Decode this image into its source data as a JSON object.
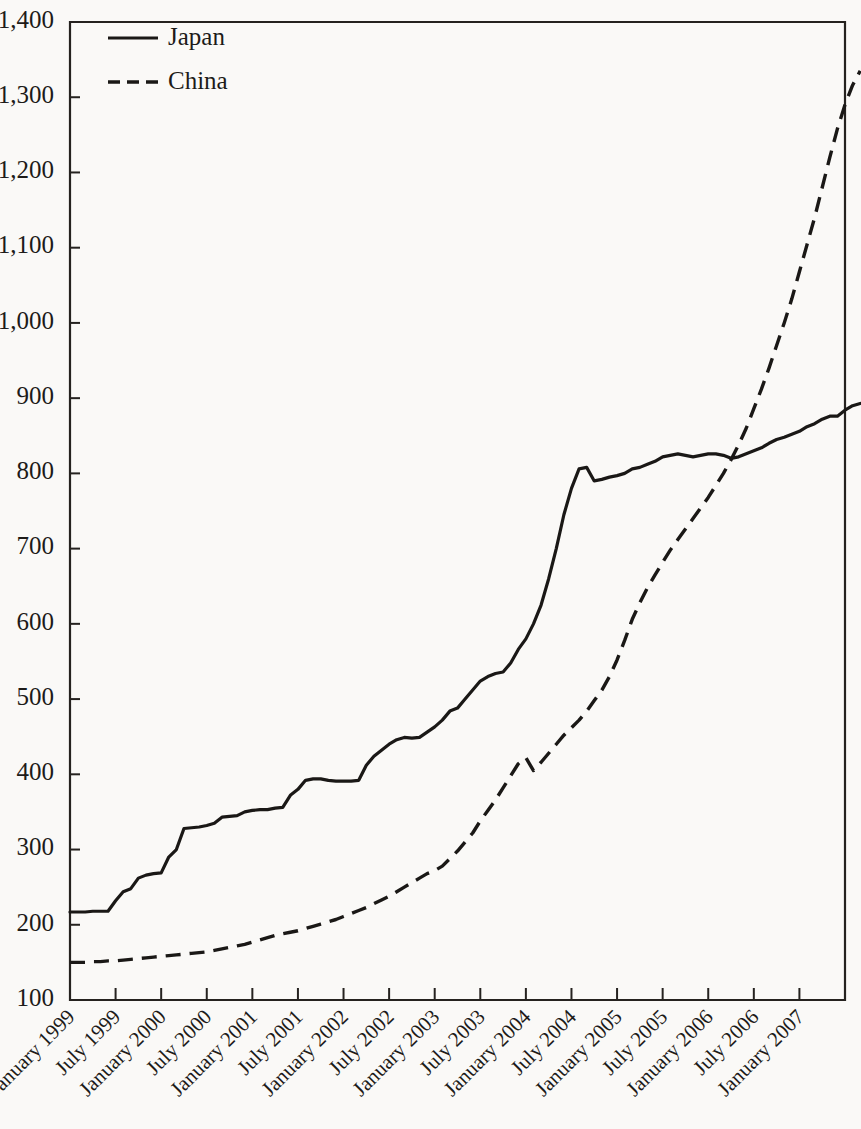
{
  "chart_data": {
    "type": "line",
    "title": "",
    "xlabel": "",
    "ylabel": "",
    "ylim": [
      100,
      1400
    ],
    "ytick_values": [
      100,
      200,
      300,
      400,
      500,
      600,
      700,
      800,
      900,
      1000,
      1100,
      1200,
      1300,
      1400
    ],
    "ytick_labels": [
      "100",
      "200",
      "300",
      "400",
      "500",
      "600",
      "700",
      "800",
      "900",
      "1,000",
      "1,100",
      "1,200",
      "1,300",
      "1,400"
    ],
    "grid": false,
    "legend_position": "top-left",
    "xtick_labels": [
      "January 1999",
      "July 1999",
      "January 2000",
      "July 2000",
      "January 2001",
      "July 2001",
      "January 2002",
      "July 2002",
      "January 2003",
      "July 2003",
      "January 2004",
      "July 2004",
      "January 2005",
      "July 2005",
      "January 2006",
      "July 2006",
      "January 2007"
    ],
    "x_start_label": "January 1999",
    "x_end_label": "July 2007",
    "x_index_range": [
      0,
      102
    ],
    "x_tick_interval_months": 6,
    "series": [
      {
        "name": "Japan",
        "style": "solid",
        "color": "#1a1816",
        "values": [
          217,
          217,
          217,
          218,
          218,
          218,
          232,
          244,
          248,
          262,
          266,
          268,
          269,
          290,
          300,
          328,
          329,
          330,
          332,
          335,
          343,
          344,
          345,
          350,
          352,
          353,
          353,
          355,
          356,
          372,
          380,
          392,
          394,
          394,
          392,
          391,
          391,
          391,
          392,
          412,
          424,
          432,
          440,
          446,
          449,
          448,
          449,
          456,
          463,
          472,
          484,
          488,
          500,
          512,
          524,
          530,
          534,
          536,
          548,
          566,
          580,
          600,
          625,
          660,
          700,
          745,
          780,
          806,
          808,
          790,
          792,
          795,
          797,
          800,
          806,
          808,
          812,
          816,
          822,
          824,
          826,
          824,
          822,
          824,
          826,
          826,
          824,
          820,
          822,
          826,
          830,
          834,
          840,
          845,
          848,
          852,
          856,
          862,
          866,
          872,
          876,
          876,
          884,
          890,
          893
        ]
      },
      {
        "name": "China",
        "style": "dashed",
        "color": "#1a1816",
        "values": [
          150,
          150,
          150,
          151,
          151,
          152,
          152,
          153,
          154,
          155,
          156,
          157,
          158,
          159,
          160,
          161,
          162,
          163,
          164,
          166,
          168,
          170,
          172,
          174,
          177,
          180,
          183,
          186,
          188,
          190,
          192,
          195,
          198,
          201,
          204,
          207,
          211,
          215,
          219,
          223,
          228,
          233,
          238,
          244,
          250,
          256,
          262,
          268,
          272,
          278,
          288,
          298,
          310,
          322,
          338,
          352,
          366,
          382,
          398,
          414,
          422,
          405,
          416,
          428,
          440,
          452,
          462,
          472,
          484,
          498,
          512,
          530,
          552,
          578,
          606,
          628,
          648,
          665,
          682,
          698,
          712,
          726,
          740,
          754,
          768,
          784,
          800,
          818,
          838,
          860,
          886,
          912,
          940,
          970,
          1000,
          1032,
          1068,
          1104,
          1140,
          1180,
          1220,
          1258,
          1290,
          1316,
          1335
        ]
      }
    ]
  },
  "legend": {
    "items": [
      {
        "label": "Japan",
        "style": "solid"
      },
      {
        "label": "China",
        "style": "dashed"
      }
    ]
  }
}
